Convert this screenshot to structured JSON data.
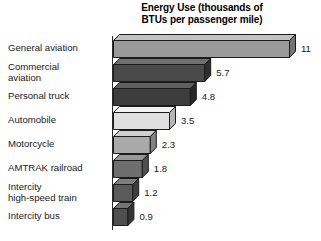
{
  "chart_data": {
    "type": "bar",
    "orientation": "horizontal",
    "style": "3d-bars",
    "title": "Energy Use (thousands of BTUs per passenger mile)",
    "title_lines": [
      "Energy Use (thousands of",
      "BTUs per passenger mile)"
    ],
    "xlabel": "",
    "ylabel": "",
    "grid": false,
    "legend": "none",
    "xlim": [
      0,
      11
    ],
    "categories": [
      "General aviation",
      "Commercial aviation",
      "Personal truck",
      "Automobile",
      "Motorcycle",
      "AMTRAK railroad",
      "Intercity high-speed train",
      "Intercity bus"
    ],
    "category_label_lines": [
      [
        "General aviation"
      ],
      [
        "Commercial",
        "aviation"
      ],
      [
        "Personal truck"
      ],
      [
        "Automobile"
      ],
      [
        "Motorcycle"
      ],
      [
        "AMTRAK railroad"
      ],
      [
        "Intercity",
        "high-speed train"
      ],
      [
        "Intercity bus"
      ]
    ],
    "values": [
      11,
      5.7,
      4.8,
      3.5,
      2.3,
      1.8,
      1.2,
      0.9
    ],
    "value_labels": [
      "11",
      "5.7",
      "4.8",
      "3.5",
      "2.3",
      "1.8",
      "1.2",
      "0.9"
    ],
    "bar_colors": [
      "#9a9a9a",
      "#4a4a4a",
      "#3d3d3d",
      "#e0e0e0",
      "#a9a9a9",
      "#6e6e6e",
      "#5a5a5a",
      "#4f4f4f"
    ],
    "bar_top_colors": [
      "#c2c2c2",
      "#707070",
      "#5f5f5f",
      "#f2f2f2",
      "#cfcfcf",
      "#989898",
      "#7e7e7e",
      "#747474"
    ],
    "bar_side_colors": [
      "#757575",
      "#2e2e2e",
      "#272727",
      "#b5b5b5",
      "#838383",
      "#4f4f4f",
      "#3c3c3c",
      "#343434"
    ],
    "outline_color": "#1c1c1c",
    "background_color": "#ffffff",
    "axis_color": "#2b2b2b"
  }
}
